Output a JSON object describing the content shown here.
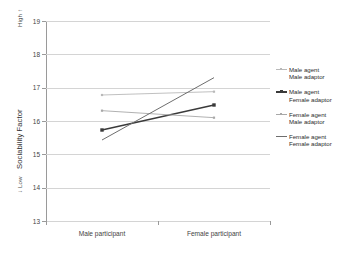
{
  "chart_data": {
    "type": "line",
    "title": "",
    "xlabel": "",
    "ylabel": "Sociability Factor",
    "ylabel_high": "High",
    "ylabel_high_arrow": "↑",
    "ylabel_low": "Low",
    "ylabel_low_arrow": "↓",
    "categories": [
      "Male participant",
      "Female participant"
    ],
    "ylim": [
      13,
      19
    ],
    "yticks": [
      13,
      14,
      15,
      16,
      17,
      18,
      19
    ],
    "grid": true,
    "legend_position": "right",
    "series": [
      {
        "name": "Male agent / Male adaptor",
        "label_line1": "Male agent",
        "label_line2": "Male adaptor",
        "values": [
          16.78,
          16.88
        ],
        "color": "#b9b9b9",
        "marker": "square",
        "width": 0.9
      },
      {
        "name": "Male agent / Female adaptor",
        "label_line1": "Male agent",
        "label_line2": "Female adaptor",
        "values": [
          15.73,
          16.48
        ],
        "color": "#3a3a3a",
        "marker": "square",
        "width": 1.3
      },
      {
        "name": "Female agent / Male adaptor",
        "label_line1": "Female agent",
        "label_line2": "Male adaptor",
        "values": [
          16.31,
          16.1
        ],
        "color": "#a8a8a8",
        "marker": "square",
        "width": 0.9
      },
      {
        "name": "Female agent / Female adaptor",
        "label_line1": "Female agent",
        "label_line2": "Female adaptor",
        "values": [
          15.43,
          17.3
        ],
        "color": "#6e6e6e",
        "marker": "none",
        "width": 1.0
      }
    ]
  }
}
